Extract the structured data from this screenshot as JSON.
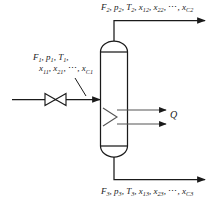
{
  "diagram": {
    "type": "process-flow-diagram",
    "background_color": "#ffffff",
    "line_color": "#1a1a1a",
    "streams": {
      "inlet": {
        "name": "feed-stream",
        "index": "1",
        "flow_symbol": "F",
        "pressure_symbol": "p",
        "temperature_symbol": "T",
        "line1": "F₁, p₁, T₁,",
        "line2": "x₁₁, x₂₁, ⋯, x_C₁",
        "composition_terms": [
          "x11",
          "x21",
          "xC1"
        ],
        "direction": "left-to-right",
        "has_valve": true,
        "valve_type": "bowtie-valve"
      },
      "vapor_outlet": {
        "name": "top-outlet-stream",
        "index": "2",
        "text": "F₂, p₂, T₂, x₁₂, x₂₂, ⋯, x_C₂",
        "composition_terms": [
          "x12",
          "x22",
          "xC2"
        ],
        "direction": "up-then-right"
      },
      "liquid_outlet": {
        "name": "bottom-outlet-stream",
        "index": "3",
        "text": "F₃, p₃, T₃, x₁₃, x₂₃, ⋯, x_C₃",
        "composition_terms": [
          "x13",
          "x23",
          "xC3"
        ],
        "direction": "down-then-right"
      },
      "heat": {
        "name": "heat-duty-stream",
        "label": "Q",
        "direction": "right",
        "arrow_count": 2
      }
    },
    "vessel": {
      "name": "separator-vessel",
      "shape": "vertical-cylinder-with-domed-heads",
      "internals": "zigzag-coil"
    },
    "labels": {
      "top": {
        "F": "F",
        "F_sub": "2",
        "p": "p",
        "p_sub": "2",
        "T": "T",
        "T_sub": "2",
        "x1": "x",
        "x1_sub": "12",
        "x2": "x",
        "x2_sub": "22",
        "ellipsis": "⋯",
        "xC": "x",
        "xC_sub": "C2"
      },
      "bottom": {
        "F": "F",
        "F_sub": "3",
        "p": "p",
        "p_sub": "3",
        "T": "T",
        "T_sub": "3",
        "x1": "x",
        "x1_sub": "13",
        "x2": "x",
        "x2_sub": "23",
        "ellipsis": "⋯",
        "xC": "x",
        "xC_sub": "C3"
      },
      "inlet": {
        "F": "F",
        "F_sub": "1",
        "p": "p",
        "p_sub": "1",
        "T": "T",
        "T_sub": "1",
        "x1": "x",
        "x1_sub": "11",
        "x2": "x",
        "x2_sub": "21",
        "ellipsis": "⋯",
        "xC": "x",
        "xC_sub": "C1"
      },
      "heat": {
        "Q": "Q"
      },
      "separators": {
        "comma": ",",
        "comma_space": ", "
      }
    }
  }
}
